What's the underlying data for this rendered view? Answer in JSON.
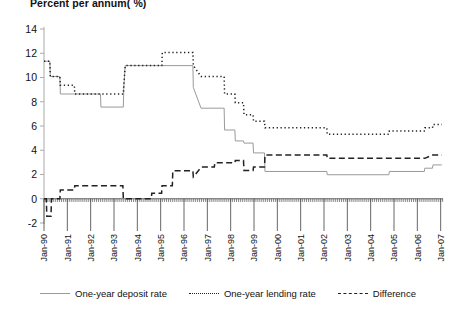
{
  "chart_data": {
    "type": "line",
    "title": "Percent per annum( %)",
    "xlabel": "",
    "ylabel": "",
    "ylim": [
      -2,
      14
    ],
    "ytick_step": 2,
    "yticks": [
      -2,
      0,
      2,
      4,
      6,
      8,
      10,
      12,
      14
    ],
    "grid": false,
    "legend_position": "bottom",
    "x_tick_labels": [
      "Jan-90",
      "Jan-91",
      "Jan-92",
      "Jan-93",
      "Jan-94",
      "Jan-95",
      "Jan-96",
      "Jan-97",
      "Jan-98",
      "Jan-99",
      "Jan-00",
      "Jan-01",
      "Jan-02",
      "Jan-03",
      "Jan-04",
      "Jan-05",
      "Jan-06",
      "Jan-07"
    ],
    "x_range": [
      "Jan-90",
      "Jan-07"
    ],
    "series": [
      {
        "name": "One-year deposit rate",
        "style": "solid",
        "color": "#9a9a9a",
        "points": [
          [
            1990.0,
            11.34
          ],
          [
            1990.25,
            11.34
          ],
          [
            1990.27,
            10.08
          ],
          [
            1990.68,
            10.08
          ],
          [
            1990.7,
            8.64
          ],
          [
            1992.42,
            8.64
          ],
          [
            1992.44,
            7.56
          ],
          [
            1993.4,
            7.56
          ],
          [
            1993.42,
            9.18
          ],
          [
            1993.48,
            10.98
          ],
          [
            1996.38,
            10.98
          ],
          [
            1996.4,
            9.18
          ],
          [
            1996.73,
            7.47
          ],
          [
            1997.72,
            7.47
          ],
          [
            1997.74,
            5.67
          ],
          [
            1998.18,
            5.67
          ],
          [
            1998.2,
            4.77
          ],
          [
            1998.55,
            4.77
          ],
          [
            1998.57,
            4.59
          ],
          [
            1998.96,
            4.59
          ],
          [
            1998.98,
            3.78
          ],
          [
            1999.45,
            3.78
          ],
          [
            1999.47,
            2.25
          ],
          [
            2002.12,
            2.25
          ],
          [
            2002.14,
            1.98
          ],
          [
            2004.78,
            1.98
          ],
          [
            2004.8,
            2.25
          ],
          [
            2006.3,
            2.25
          ],
          [
            2006.32,
            2.52
          ],
          [
            2006.65,
            2.52
          ],
          [
            2006.67,
            2.79
          ],
          [
            2007.05,
            2.79
          ]
        ]
      },
      {
        "name": "One-year lending rate",
        "style": "dotted",
        "color": "#222222",
        "points": [
          [
            1990.0,
            11.34
          ],
          [
            1990.25,
            11.34
          ],
          [
            1990.27,
            10.08
          ],
          [
            1990.68,
            10.08
          ],
          [
            1990.7,
            9.36
          ],
          [
            1991.3,
            9.36
          ],
          [
            1991.32,
            8.64
          ],
          [
            1993.4,
            8.64
          ],
          [
            1993.42,
            9.36
          ],
          [
            1993.48,
            10.98
          ],
          [
            1995.05,
            10.98
          ],
          [
            1995.07,
            12.06
          ],
          [
            1996.38,
            12.06
          ],
          [
            1996.4,
            10.98
          ],
          [
            1996.73,
            10.08
          ],
          [
            1997.72,
            10.08
          ],
          [
            1997.74,
            8.64
          ],
          [
            1998.18,
            8.64
          ],
          [
            1998.2,
            7.92
          ],
          [
            1998.55,
            7.92
          ],
          [
            1998.57,
            6.93
          ],
          [
            1998.96,
            6.93
          ],
          [
            1998.98,
            6.39
          ],
          [
            1999.45,
            6.39
          ],
          [
            1999.47,
            5.85
          ],
          [
            2002.12,
            5.85
          ],
          [
            2002.14,
            5.31
          ],
          [
            2004.78,
            5.31
          ],
          [
            2004.8,
            5.58
          ],
          [
            2006.3,
            5.58
          ],
          [
            2006.32,
            5.85
          ],
          [
            2006.65,
            5.85
          ],
          [
            2006.67,
            6.12
          ],
          [
            2007.05,
            6.12
          ]
        ]
      },
      {
        "name": "Difference",
        "style": "dashed",
        "color": "#222222",
        "points": [
          [
            1990.0,
            0.0
          ],
          [
            1990.1,
            0.0
          ],
          [
            1990.12,
            -1.45
          ],
          [
            1990.3,
            -1.45
          ],
          [
            1990.32,
            0.0
          ],
          [
            1990.68,
            0.0
          ],
          [
            1990.7,
            0.72
          ],
          [
            1991.3,
            0.72
          ],
          [
            1991.32,
            1.08
          ],
          [
            1992.42,
            1.08
          ],
          [
            1992.44,
            1.08
          ],
          [
            1993.38,
            1.08
          ],
          [
            1993.4,
            0.0
          ],
          [
            1993.48,
            0.0
          ],
          [
            1994.6,
            0.0
          ],
          [
            1994.62,
            0.45
          ],
          [
            1995.04,
            0.45
          ],
          [
            1995.06,
            1.08
          ],
          [
            1995.5,
            1.08
          ],
          [
            1995.52,
            2.3
          ],
          [
            1996.38,
            2.3
          ],
          [
            1996.4,
            1.8
          ],
          [
            1996.74,
            2.61
          ],
          [
            1997.3,
            2.61
          ],
          [
            1997.32,
            2.97
          ],
          [
            1997.72,
            2.97
          ],
          [
            1997.74,
            2.97
          ],
          [
            1998.18,
            2.97
          ],
          [
            1998.2,
            3.15
          ],
          [
            1998.55,
            3.15
          ],
          [
            1998.57,
            2.34
          ],
          [
            1998.96,
            2.34
          ],
          [
            1998.98,
            2.61
          ],
          [
            1999.45,
            2.61
          ],
          [
            1999.47,
            3.6
          ],
          [
            2002.12,
            3.6
          ],
          [
            2002.14,
            3.33
          ],
          [
            2004.78,
            3.33
          ],
          [
            2004.8,
            3.33
          ],
          [
            2006.3,
            3.33
          ],
          [
            2006.32,
            3.33
          ],
          [
            2006.65,
            3.6
          ],
          [
            2007.05,
            3.6
          ]
        ]
      }
    ]
  },
  "legend": {
    "items": [
      {
        "label": "One-year deposit rate",
        "style": "solid"
      },
      {
        "label": "One-year lending rate",
        "style": "dotted"
      },
      {
        "label": "Difference",
        "style": "dashed"
      }
    ]
  }
}
